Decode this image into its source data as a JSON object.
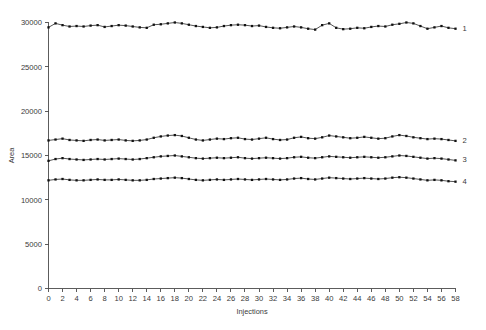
{
  "chart_data": {
    "type": "line",
    "title": "",
    "xlabel": "Injections",
    "ylabel": "Area",
    "xlim": [
      0,
      58
    ],
    "ylim": [
      0,
      30000
    ],
    "grid": false,
    "legend_position": "right-end-inline",
    "xticks": [
      0,
      2,
      4,
      6,
      8,
      10,
      12,
      14,
      16,
      18,
      20,
      22,
      24,
      26,
      28,
      30,
      32,
      34,
      36,
      38,
      40,
      42,
      44,
      46,
      48,
      50,
      52,
      54,
      56,
      58
    ],
    "xtick_labels": [
      "0",
      "2",
      "4",
      "6",
      "8",
      "10",
      "12",
      "14",
      "16",
      "18",
      "20",
      "22",
      "24",
      "26",
      "28",
      "30",
      "32",
      "34",
      "36",
      "38",
      "40",
      "42",
      "44",
      "46",
      "48",
      "50",
      "52",
      "54",
      "56",
      "58"
    ],
    "yticks": [
      0,
      5000,
      10000,
      15000,
      20000,
      25000,
      30000
    ],
    "ytick_labels": [
      "0",
      "5000",
      "10000",
      "15000",
      "20000",
      "25000",
      "30000"
    ],
    "marker": "filled-square",
    "line_color": "#1a1a1a",
    "marker_color": "#111111",
    "x": [
      0,
      1,
      2,
      3,
      4,
      5,
      6,
      7,
      8,
      9,
      10,
      11,
      12,
      13,
      14,
      15,
      16,
      17,
      18,
      19,
      20,
      21,
      22,
      23,
      24,
      25,
      26,
      27,
      28,
      29,
      30,
      31,
      32,
      33,
      34,
      35,
      36,
      37,
      38,
      39,
      40,
      41,
      42,
      43,
      44,
      45,
      46,
      47,
      48,
      49,
      50,
      51,
      52,
      53,
      54,
      55,
      56,
      57,
      58
    ],
    "series": [
      {
        "name": "1",
        "label": "1",
        "values": [
          29450,
          29900,
          29700,
          29550,
          29600,
          29550,
          29650,
          29700,
          29500,
          29600,
          29700,
          29650,
          29550,
          29450,
          29400,
          29750,
          29800,
          29900,
          30000,
          29900,
          29750,
          29600,
          29500,
          29400,
          29450,
          29600,
          29700,
          29750,
          29700,
          29600,
          29650,
          29500,
          29400,
          29350,
          29450,
          29550,
          29450,
          29300,
          29200,
          29700,
          29900,
          29400,
          29250,
          29300,
          29400,
          29350,
          29500,
          29600,
          29550,
          29750,
          29850,
          30000,
          29900,
          29600,
          29300,
          29450,
          29600,
          29400,
          29300
        ]
      },
      {
        "name": "2",
        "label": "2",
        "values": [
          16700,
          16800,
          16900,
          16750,
          16700,
          16650,
          16750,
          16800,
          16700,
          16750,
          16800,
          16700,
          16650,
          16700,
          16800,
          17000,
          17150,
          17250,
          17300,
          17200,
          17000,
          16800,
          16700,
          16800,
          16900,
          16850,
          16950,
          17000,
          16850,
          16800,
          16900,
          17000,
          16850,
          16750,
          16800,
          17000,
          17100,
          16950,
          16900,
          17050,
          17250,
          17150,
          17050,
          16950,
          17000,
          17100,
          17000,
          16900,
          16950,
          17150,
          17300,
          17200,
          17050,
          16950,
          16850,
          16900,
          16850,
          16750,
          16650
        ]
      },
      {
        "name": "3",
        "label": "3",
        "values": [
          14400,
          14600,
          14700,
          14600,
          14550,
          14500,
          14550,
          14600,
          14550,
          14600,
          14650,
          14600,
          14550,
          14600,
          14700,
          14800,
          14900,
          14950,
          15000,
          14900,
          14800,
          14700,
          14650,
          14700,
          14750,
          14700,
          14750,
          14800,
          14700,
          14650,
          14700,
          14750,
          14700,
          14650,
          14700,
          14800,
          14850,
          14750,
          14700,
          14800,
          14900,
          14850,
          14800,
          14750,
          14800,
          14850,
          14800,
          14750,
          14800,
          14900,
          15000,
          14950,
          14850,
          14750,
          14650,
          14700,
          14650,
          14550,
          14450
        ]
      },
      {
        "name": "4",
        "label": "4",
        "values": [
          12200,
          12300,
          12350,
          12250,
          12200,
          12200,
          12250,
          12300,
          12250,
          12250,
          12300,
          12250,
          12200,
          12200,
          12250,
          12350,
          12400,
          12450,
          12500,
          12450,
          12350,
          12250,
          12200,
          12250,
          12300,
          12250,
          12300,
          12350,
          12300,
          12250,
          12300,
          12350,
          12300,
          12250,
          12300,
          12400,
          12450,
          12350,
          12300,
          12400,
          12500,
          12450,
          12400,
          12350,
          12400,
          12450,
          12400,
          12350,
          12400,
          12500,
          12550,
          12500,
          12400,
          12300,
          12200,
          12250,
          12200,
          12100,
          12050
        ]
      }
    ]
  }
}
